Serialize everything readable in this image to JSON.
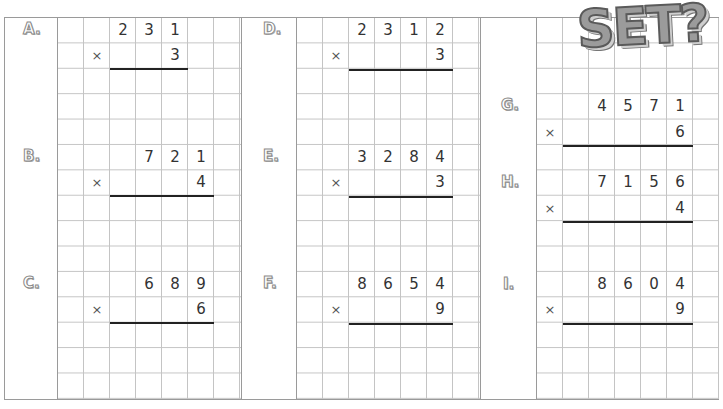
{
  "logo": {
    "text": "SET?"
  },
  "problems": [
    {
      "label": "A.",
      "multiplicand": [
        "2",
        "3",
        "1"
      ],
      "multiplier": "3"
    },
    {
      "label": "B.",
      "multiplicand": [
        "7",
        "2",
        "1"
      ],
      "multiplier": "4"
    },
    {
      "label": "C.",
      "multiplicand": [
        "6",
        "8",
        "9"
      ],
      "multiplier": "6"
    },
    {
      "label": "D.",
      "multiplicand": [
        "2",
        "3",
        "1",
        "2"
      ],
      "multiplier": "3"
    },
    {
      "label": "E.",
      "multiplicand": [
        "3",
        "2",
        "8",
        "4"
      ],
      "multiplier": "3"
    },
    {
      "label": "F.",
      "multiplicand": [
        "8",
        "6",
        "5",
        "4"
      ],
      "multiplier": "9"
    },
    {
      "label": "G.",
      "multiplicand": [
        "4",
        "5",
        "7",
        "1"
      ],
      "multiplier": "6"
    },
    {
      "label": "H.",
      "multiplicand": [
        "7",
        "1",
        "5",
        "6"
      ],
      "multiplier": "4"
    },
    {
      "label": "I.",
      "multiplicand": [
        "8",
        "6",
        "0",
        "4"
      ],
      "multiplier": "9"
    }
  ],
  "symbols": {
    "times": "×"
  }
}
